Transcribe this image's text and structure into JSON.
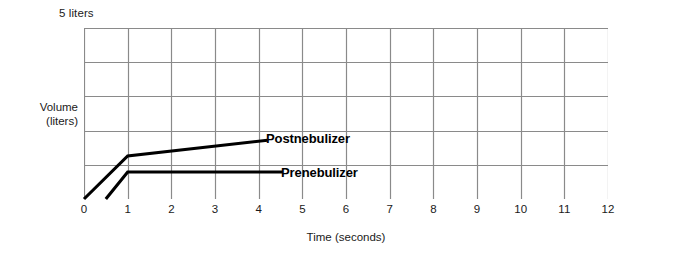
{
  "chart_data": {
    "type": "line",
    "title": "",
    "subtitle": "",
    "top_caption": "5 liters",
    "xlabel": "Time (seconds)",
    "ylabel": "Volume\n(liters)",
    "ylabel_lines": [
      "Volume",
      "(liters)"
    ],
    "xlim": [
      0,
      12
    ],
    "ylim": [
      0,
      5
    ],
    "xticks": [
      0,
      1,
      2,
      3,
      4,
      5,
      6,
      7,
      8,
      9,
      10,
      11,
      12
    ],
    "xtick_labels": [
      "0",
      "1",
      "2",
      "3",
      "4",
      "5",
      "6",
      "7",
      "8",
      "9",
      "10",
      "11",
      "12"
    ],
    "yticks": [
      0,
      1,
      2,
      3,
      4,
      5
    ],
    "grid": true,
    "grid_color": "#8a8a8a",
    "legend": "inline-annotations",
    "line_color": "#000000",
    "series": [
      {
        "name": "Postnebulizer",
        "label": "Postnebulizer",
        "color": "#000000",
        "points": [
          {
            "x": 0.0,
            "y": 0.0
          },
          {
            "x": 1.0,
            "y": 1.26
          },
          {
            "x": 4.2,
            "y": 1.72
          }
        ]
      },
      {
        "name": "Prenebulizer",
        "label": "Prenebulizer",
        "color": "#000000",
        "points": [
          {
            "x": 0.5,
            "y": 0.0
          },
          {
            "x": 1.0,
            "y": 0.79
          },
          {
            "x": 4.55,
            "y": 0.79
          }
        ]
      }
    ]
  },
  "annotations": {
    "postnebulizer_label": "Postnebulizer",
    "prenebulizer_label": "Prenebulizer"
  },
  "axes": {
    "x_title": "Time (seconds)",
    "y_title_line1": "Volume",
    "y_title_line2": "(liters)",
    "top_caption": "5 liters"
  }
}
